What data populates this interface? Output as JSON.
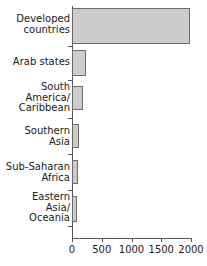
{
  "chart_data": {
    "type": "bar",
    "orientation": "horizontal",
    "title": "",
    "xlabel": "",
    "ylabel": "",
    "categories": [
      "Developed\ncountries",
      "Arab states",
      "South\nAmerica/\nCaribbean",
      "Southern\nAsia",
      "Sub-Saharan\nAfrica",
      "Eastern\nAsia/\nOceania"
    ],
    "values": [
      1975,
      235,
      185,
      110,
      95,
      90
    ],
    "xlim": [
      0,
      2000
    ],
    "xticks": [
      0,
      500,
      1000,
      1500,
      2000
    ],
    "xtick_labels": [
      "0",
      "500",
      "1000",
      "1500",
      "2000"
    ],
    "grid": false,
    "legend": false,
    "bar_fill_color": "#cccccc",
    "bar_edge_color": "#6b6b6b",
    "axis_color": "#555555",
    "text_color": "#1a1a1a"
  },
  "bars": [
    {
      "label": "Developed\ncountries",
      "value": 1975,
      "top": 8,
      "height": 36,
      "label_top": 14
    },
    {
      "label": "Arab states",
      "value": 235,
      "top": 50,
      "height": 26,
      "label_top": 57
    },
    {
      "label": "South\nAmerica/\nCaribbean",
      "top": 86,
      "height": 24,
      "value": 185,
      "label_top": 82
    },
    {
      "label": "Southern\nAsia",
      "top": 124,
      "height": 24,
      "value": 110,
      "label_top": 126
    },
    {
      "label": "Sub-Saharan\nAfrica",
      "top": 160,
      "height": 24,
      "value": 95,
      "label_top": 162
    },
    {
      "label": "Eastern\nAsia/\nOceania",
      "top": 196,
      "height": 26,
      "value": 90,
      "label_top": 192
    }
  ]
}
